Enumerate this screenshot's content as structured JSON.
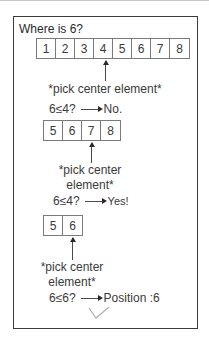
{
  "title": "Where is 6?",
  "steps": [
    {
      "array": [
        "1",
        "2",
        "3",
        "4",
        "5",
        "6",
        "7",
        "8"
      ],
      "pointer_index": 3,
      "note": "*pick center element*",
      "comparison": "6≤4?",
      "result": "No."
    },
    {
      "array": [
        "5",
        "6",
        "7",
        "8"
      ],
      "pointer_index": 2,
      "note_line1": "*pick center",
      "note_line2": "element*",
      "comparison": "6≤4?",
      "result": "Yes!"
    },
    {
      "array": [
        "5",
        "6"
      ],
      "pointer_index": 1,
      "note_line1": "*pick center",
      "note_line2": "element*",
      "comparison": "6≤6?",
      "result": "Position :6"
    }
  ],
  "footer_icon": "checkmark-icon",
  "colors": {
    "frame": "#3a3a3a",
    "text": "#2a2a2a",
    "cell_border": "#7a7a7a",
    "check": "#b0b0b0"
  }
}
